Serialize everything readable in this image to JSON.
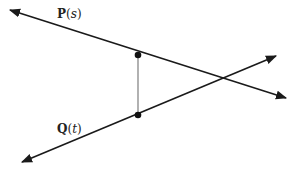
{
  "diagram": {
    "type": "skew-lines-shortest-distance",
    "lines": [
      {
        "id": "P",
        "label_name": "P",
        "label_open": "(",
        "label_param": "s",
        "label_close": ")",
        "start": [
          10,
          10
        ],
        "end": [
          286,
          98
        ],
        "point_on_line": [
          138,
          55
        ]
      },
      {
        "id": "Q",
        "label_name": "Q",
        "label_open": "(",
        "label_param": "t",
        "label_close": ")",
        "start": [
          22,
          162
        ],
        "end": [
          276,
          56
        ],
        "point_on_line": [
          138,
          115
        ]
      }
    ],
    "connector": {
      "from": [
        138,
        55
      ],
      "to": [
        138,
        115
      ],
      "color": "#888888"
    },
    "colors": {
      "line": "#1a1a1a",
      "point": "#111111",
      "background": "#ffffff"
    }
  }
}
